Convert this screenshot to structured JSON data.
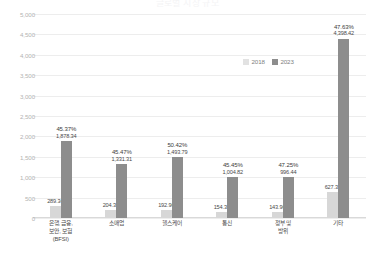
{
  "title": "글로벌 시장 규모",
  "legend": {
    "position": "top-right",
    "items": [
      {
        "label": "2018",
        "color": "#e2e2e2",
        "name": "legend-2018"
      },
      {
        "label": "2023",
        "color": "#8d8d8d",
        "name": "legend-2023"
      }
    ]
  },
  "axis": {
    "yticks": [
      "5,000",
      "4,500",
      "4,000",
      "3,500",
      "3,000",
      "2,500",
      "2,000",
      "1,500",
      "1,000",
      "500",
      "0"
    ]
  },
  "chart_data": {
    "type": "bar",
    "title": "글로벌 시장 규모",
    "xlabel": "",
    "ylabel": "",
    "ylim": [
      0,
      5000
    ],
    "ytick_step": 500,
    "grid": true,
    "legend_position": "top-right",
    "categories": [
      "은행, 금융, 보안, 보험 (BFSI)",
      "소매업",
      "헬스케어",
      "통신",
      "정부 및 방위",
      "기타"
    ],
    "category_lines": [
      [
        "은행, 금융,",
        "보안, 보험",
        "(BFSI)"
      ],
      [
        "소매업"
      ],
      [
        "헬스케어"
      ],
      [
        "통신"
      ],
      [
        "정부 및",
        "방위"
      ],
      [
        "기타"
      ]
    ],
    "series": [
      {
        "name": "2018",
        "color": "#d7d7d7",
        "values": [
          289.34,
          204.36,
          192.96,
          154.36,
          143.96,
          627.33
        ],
        "labels": [
          "289.34",
          "204.36",
          "192.96",
          "154.36",
          "143.96",
          "627.33"
        ]
      },
      {
        "name": "2023",
        "color": "#8d8d8d",
        "values": [
          1878.34,
          1331.31,
          1493.79,
          1004.82,
          996.44,
          4398.42
        ],
        "labels": [
          "1,878.34",
          "1,331.31",
          "1,493.79",
          "1,004.82",
          "996.44",
          "4,398.42"
        ]
      }
    ],
    "annotations": {
      "name": "growth-percent-above-2023-bar",
      "values": [
        "45.37%",
        "45.47%",
        "50.42%",
        "45.45%",
        "47.25%",
        "47.63%"
      ]
    }
  }
}
